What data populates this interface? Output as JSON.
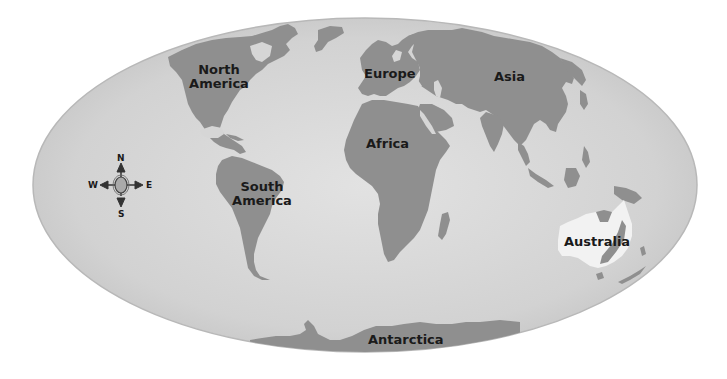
{
  "map": {
    "projection": "oval world map",
    "colors": {
      "ocean": "#d3d3d3",
      "ocean_edge": "#bdbdbd",
      "land": "#8f8f8f",
      "highlight": "#f2f2f2",
      "label": "#1a1a1a",
      "background": "#ffffff"
    },
    "highlighted_continent": "Australia",
    "continents": [
      {
        "id": "north-america",
        "label": "North America",
        "line1": "North",
        "line2": "America"
      },
      {
        "id": "south-america",
        "label": "South America",
        "line1": "South",
        "line2": "America"
      },
      {
        "id": "europe",
        "label": "Europe"
      },
      {
        "id": "asia",
        "label": "Asia"
      },
      {
        "id": "africa",
        "label": "Africa"
      },
      {
        "id": "australia",
        "label": "Australia"
      },
      {
        "id": "antarctica",
        "label": "Antarctica"
      }
    ]
  },
  "compass": {
    "icon": "compass-rose-icon",
    "north": "N",
    "south": "S",
    "east": "E",
    "west": "W"
  }
}
